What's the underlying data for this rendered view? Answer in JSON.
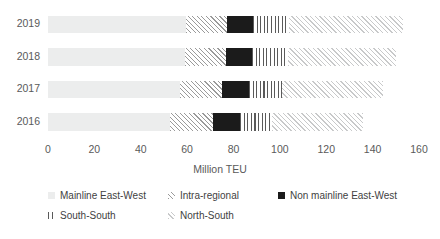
{
  "chart_data": {
    "type": "bar",
    "orientation": "horizontal",
    "stacked": true,
    "title": "",
    "xlabel": "Million TEU",
    "ylabel": "",
    "xlim": [
      0,
      160
    ],
    "xticks": [
      0,
      20,
      40,
      60,
      80,
      100,
      120,
      140,
      160
    ],
    "grid": false,
    "legend_position": "bottom",
    "categories": [
      "2019",
      "2018",
      "2017",
      "2016"
    ],
    "series": [
      {
        "name": "Mainline East-West",
        "key": "mainline",
        "values": [
          59.5,
          59.0,
          57.0,
          52.6
        ]
      },
      {
        "name": "Intra-regional",
        "key": "intra",
        "values": [
          17.5,
          17.7,
          18.0,
          18.4
        ]
      },
      {
        "name": "Non mainline East-West",
        "key": "nonmainline",
        "values": [
          11.5,
          11.3,
          11.7,
          11.8
        ]
      },
      {
        "name": "South-South",
        "key": "southsouth",
        "values": [
          15.5,
          15.5,
          14.3,
          13.7
        ]
      },
      {
        "name": "North-South",
        "key": "northsouth",
        "values": [
          49.0,
          46.5,
          43.5,
          39.3
        ]
      }
    ],
    "totals": [
      153.0,
      150.0,
      144.5,
      135.8
    ]
  },
  "axis": {
    "x_title": "Million TEU",
    "x_ticks": [
      "0",
      "20",
      "40",
      "60",
      "80",
      "100",
      "120",
      "140",
      "160"
    ],
    "y_ticks": [
      "2019",
      "2018",
      "2017",
      "2016"
    ]
  },
  "legend": {
    "items": [
      {
        "label": "Mainline East-West",
        "key": "mainline",
        "color": "#eceded"
      },
      {
        "label": "Intra-regional",
        "key": "intra",
        "color": "#9a9a9a"
      },
      {
        "label": "Non mainline East-West",
        "key": "nonmainline",
        "color": "#1b1b1b"
      },
      {
        "label": "South-South",
        "key": "southsouth",
        "color": "#5a5a5a"
      },
      {
        "label": "North-South",
        "key": "northsouth",
        "color": "#c8c9ca"
      }
    ]
  }
}
